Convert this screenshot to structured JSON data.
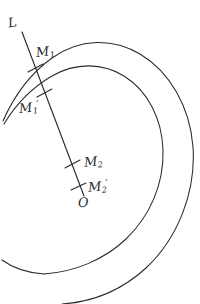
{
  "figure": {
    "kind": "hand-drawn-geometry-diagram",
    "background_color": "#ffffff",
    "ink_color": "#2b2b2b",
    "width": 200,
    "height": 304
  },
  "labels": {
    "ray": {
      "base": "L",
      "sub": "",
      "prime": ""
    },
    "m1": {
      "base": "M",
      "sub": "1",
      "prime": ""
    },
    "m1_prime": {
      "base": "M",
      "sub": "1",
      "prime": "′"
    },
    "m2": {
      "base": "M",
      "sub": "2",
      "prime": ""
    },
    "m2_prime": {
      "base": "M",
      "sub": "2",
      "prime": "′"
    },
    "origin": {
      "base": "O",
      "sub": "",
      "prime": ""
    }
  },
  "geometry": {
    "pole": {
      "x": 83,
      "y": 194
    },
    "ray": {
      "start": {
        "x": 22,
        "y": 32
      },
      "end": {
        "x": 84,
        "y": 196
      }
    },
    "intersections": [
      {
        "name": "M1",
        "x": 35,
        "y": 68
      },
      {
        "name": "M1-prime",
        "x": 44,
        "y": 93
      },
      {
        "name": "M2",
        "x": 72,
        "y": 164
      },
      {
        "name": "M2-prime",
        "x": 78,
        "y": 186
      }
    ],
    "outer_arm_path": "M 3,121 C 14,96 31,73 52,58 C 80,38 113,38 140,54 C 170,72 190,107 193,147 C 196,192 178,238 146,268 C 122,290 92,302 62,304",
    "inner_arm_path": "M 4,124 C 16,104 33,87 52,76 C 76,62 103,63 124,76 C 148,91 162,119 163,150 C 164,184 150,216 126,239 C 104,260 74,272 44,274",
    "core_arm_path": "M 44,274 C 28,273 13,268 2,260"
  }
}
